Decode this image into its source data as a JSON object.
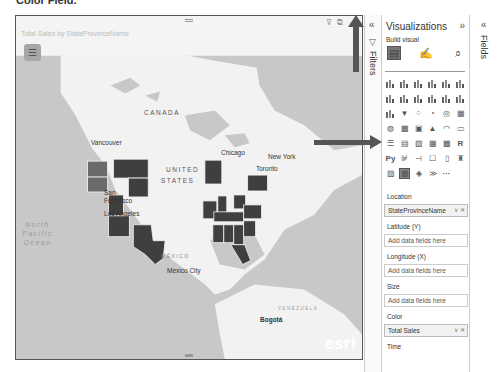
{
  "page": {
    "heading_fragment": "Color Field."
  },
  "visual": {
    "title": "Total Sales by StateProvinceName",
    "header_icons": [
      "filter-icon",
      "focus-mode-icon",
      "more-options-icon"
    ],
    "header_glyphs": {
      "filter": "⊽",
      "focus": "⧉",
      "more": "···"
    },
    "menu_glyph": "☰",
    "map": {
      "region_labels": {
        "canada": "CANADA",
        "united": "UNITED",
        "states": "STATES",
        "mexico": "MÉXICO",
        "venezuela": "VENEZUELA"
      },
      "cities": [
        "Vancouver",
        "San Francisco",
        "Los Angeles",
        "Chicago",
        "Toronto",
        "New York",
        "Mexico City",
        "Bogotá"
      ],
      "ocean_label": [
        "North",
        "Pacific",
        "Ocean"
      ],
      "attribution": "esri",
      "colors": {
        "water": "#c8c8c8",
        "land": "#f4f4f4",
        "state_dark": "#3f3f3f",
        "state_mid": "#6a6a6a"
      }
    }
  },
  "filters_pane": {
    "label": "Filters",
    "collapse_glyph": "«",
    "filter_glyph": "▽"
  },
  "visualizations_pane": {
    "title": "Visualizations",
    "expand_glyph": "»",
    "build_visual_label": "Build visual",
    "build_tabs": [
      {
        "name": "build-visual-tab",
        "glyph": "▤"
      },
      {
        "name": "format-visual-tab",
        "glyph": "✍"
      },
      {
        "name": "analytics-tab",
        "glyph": "⌕"
      }
    ],
    "gallery_text_items": {
      "r": "R",
      "py": "Py",
      "more": "···"
    },
    "wells": [
      {
        "label": "Location",
        "value": "StateProvinceName",
        "filled": true
      },
      {
        "label": "Latitude (Y)",
        "value": "Add data fields here",
        "filled": false
      },
      {
        "label": "Longitude (X)",
        "value": "Add data fields here",
        "filled": false
      },
      {
        "label": "Size",
        "value": "Add data fields here",
        "filled": false
      },
      {
        "label": "Color",
        "value": "Total Sales",
        "filled": true
      },
      {
        "label": "Time",
        "value": "",
        "filled": false
      }
    ],
    "well_controls": "∨ ✕"
  },
  "fields_pane": {
    "label": "Fields",
    "collapse_glyph": "«"
  }
}
